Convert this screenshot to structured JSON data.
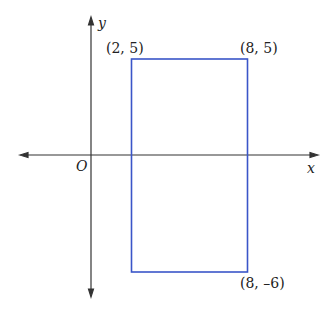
{
  "diagram": {
    "type": "coordinate-plane",
    "axes": {
      "x_label": "x",
      "y_label": "y",
      "origin_label": "O",
      "axis_color": "#333333"
    },
    "rectangle": {
      "stroke_color": "#3a55c8",
      "vertices_labeled": [
        {
          "label": "(2, 5)",
          "x": 2,
          "y": 5
        },
        {
          "label": "(8, 5)",
          "x": 8,
          "y": 5
        },
        {
          "label": "(8, –6)",
          "x": 8,
          "y": -6
        }
      ],
      "vertices_all": [
        {
          "x": 2,
          "y": 5
        },
        {
          "x": 8,
          "y": 5
        },
        {
          "x": 8,
          "y": -6
        },
        {
          "x": 2,
          "y": -6
        }
      ]
    }
  }
}
